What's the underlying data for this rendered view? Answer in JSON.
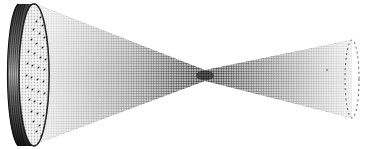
{
  "figure": {
    "description": "Halftone illustration of a focused beam: a circular disc emitter converging to a focal point and diverging beyond",
    "colors": {
      "ink": "#111111",
      "background": "#ffffff",
      "beam_dark": "#1a1a1a",
      "beam_light": "#d8d8d8"
    },
    "parts": {
      "emitter": {
        "label": "disc emitter",
        "cx": 30,
        "cy": 74,
        "rx": 16,
        "ry": 72
      },
      "focal_point": {
        "label": "focal point",
        "x": 205,
        "y": 75
      },
      "far_field": {
        "label": "far-field cross-section",
        "cx": 352,
        "cy": 79,
        "rx": 8,
        "ry": 39
      }
    }
  }
}
